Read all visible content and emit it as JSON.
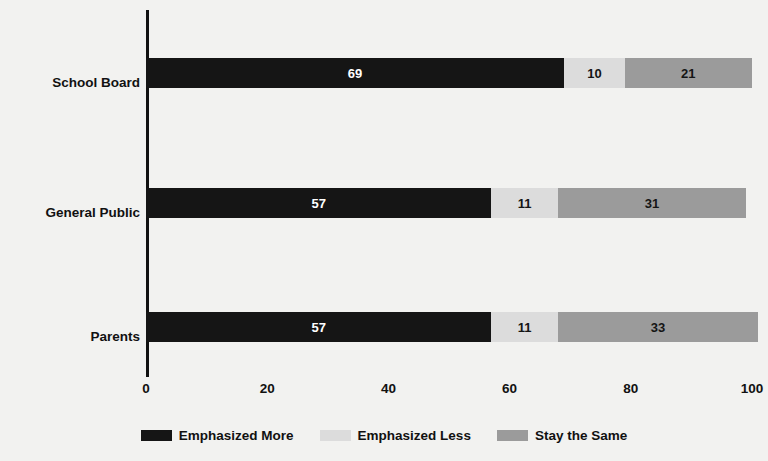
{
  "chart_data": {
    "type": "bar",
    "orientation": "horizontal",
    "stacked": true,
    "title": "",
    "subtitle": "",
    "xlabel": "",
    "ylabel": "",
    "categories": [
      "School Board",
      "General Public",
      "Parents"
    ],
    "xticks": [
      "0",
      "20",
      "40",
      "60",
      "80",
      "100"
    ],
    "xlim": [
      0,
      100
    ],
    "grid": false,
    "legend_position": "bottom",
    "series": [
      {
        "name": "Emphasized More",
        "color": "#151515",
        "values": [
          69,
          57,
          57
        ],
        "labels": [
          "69",
          "57",
          "57"
        ]
      },
      {
        "name": "Emphasized Less",
        "color": "#dcdcdc",
        "values": [
          10,
          11,
          11
        ],
        "labels": [
          "10",
          "11",
          "11"
        ]
      },
      {
        "name": "Stay the Same",
        "color": "#9b9b9b",
        "values": [
          21,
          31,
          33
        ],
        "labels": [
          "21",
          "31",
          "33"
        ]
      }
    ]
  },
  "axis": {
    "ticks": [
      {
        "label": "0",
        "value": 0
      },
      {
        "label": "20",
        "value": 20
      },
      {
        "label": "40",
        "value": 40
      },
      {
        "label": "60",
        "value": 60
      },
      {
        "label": "80",
        "value": 80
      },
      {
        "label": "100",
        "value": 100
      }
    ]
  },
  "legend": {
    "items": [
      {
        "label": "Emphasized More",
        "color": "#151515"
      },
      {
        "label": "Emphasized Less",
        "color": "#dcdcdc"
      },
      {
        "label": "Stay the Same",
        "color": "#9b9b9b"
      }
    ]
  },
  "colors": {
    "background": "#f2f2f0",
    "axis": "#111111",
    "text": "#111111",
    "emphasized_more": "#151515",
    "emphasized_less": "#dcdcdc",
    "stay_the_same": "#9b9b9b"
  }
}
